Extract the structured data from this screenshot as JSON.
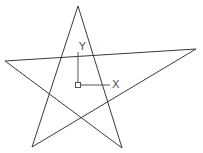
{
  "drawing": {
    "background": "#ffffff",
    "line_color": "#3a3a3a",
    "star": {
      "points": "78,6 122,148 5,61 196,49 32,147"
    },
    "ucs_icon": {
      "color": "#555555",
      "x_label": "X",
      "y_label": "Y"
    }
  }
}
